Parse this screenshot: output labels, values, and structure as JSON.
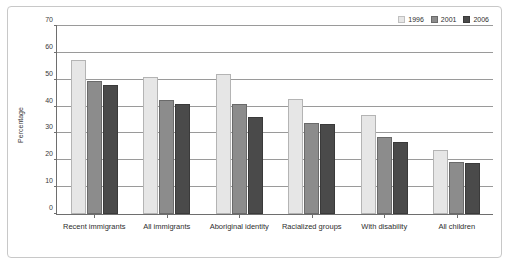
{
  "chart_data": {
    "type": "bar",
    "title": "",
    "xlabel": "",
    "ylabel": "Percentage",
    "ylim": [
      0,
      70
    ],
    "yticks": [
      0,
      10,
      20,
      30,
      40,
      50,
      60,
      70
    ],
    "grid": true,
    "legend_position": "top-right",
    "categories": [
      "Recent immigrants",
      "All immigrants",
      "Aboriginal identity",
      "Racialized groups",
      "With disability",
      "All children"
    ],
    "series": [
      {
        "name": "1996",
        "color": "#e6e6e6",
        "values": [
          57.5,
          51.0,
          52.0,
          43.0,
          37.0,
          24.0
        ]
      },
      {
        "name": "2001",
        "color": "#8c8c8c",
        "values": [
          49.5,
          42.5,
          41.0,
          34.0,
          28.5,
          19.5
        ]
      },
      {
        "name": "2006",
        "color": "#4a4a4a",
        "values": [
          48.0,
          41.0,
          36.0,
          33.5,
          27.0,
          19.0
        ]
      }
    ]
  }
}
